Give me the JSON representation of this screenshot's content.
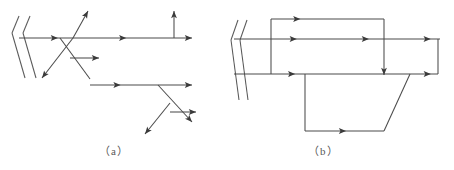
{
  "figure": {
    "background_color": "#ffffff",
    "line_color": "#4b4b4b",
    "arrow_color": "#3a3a3a",
    "width": 454,
    "height": 170
  },
  "panels": [
    {
      "id": "panel-a",
      "caption": "（a）",
      "caption_plain": "( a )",
      "caption_position": {
        "x": 99,
        "y": 142
      },
      "description": "Branching ray diagram with a tilted mirror at the left and multiple split beams",
      "mirror": {
        "name": "mirror-a",
        "lines": [
          {
            "x1": 19,
            "y1": 16,
            "x2": 12,
            "y2": 33
          },
          {
            "x1": 30,
            "y1": 16,
            "x2": 23,
            "y2": 33
          },
          {
            "x1": 12,
            "y1": 33,
            "x2": 25,
            "y2": 78
          },
          {
            "x1": 23,
            "y1": 33,
            "x2": 36,
            "y2": 78
          }
        ]
      },
      "rays": [
        {
          "name": "ray-incident-horizontal",
          "x1": 19,
          "y1": 38,
          "x2": 192,
          "y2": 38,
          "arrows": [
            {
              "at": 0.225,
              "dir": 0
            },
            {
              "at": 0.62,
              "dir": 0
            },
            {
              "at": 1.0,
              "dir": 0
            }
          ]
        },
        {
          "name": "ray-up-right-branch",
          "x1": 73,
          "y1": 38,
          "x2": 88,
          "y2": 11,
          "arrows": [
            {
              "at": 1.0,
              "dir": -61
            }
          ]
        },
        {
          "name": "ray-down-left-branch",
          "x1": 73,
          "y1": 38,
          "x2": 42,
          "y2": 78,
          "arrows": [
            {
              "at": 1.0,
              "dir": 128
            }
          ]
        },
        {
          "name": "ray-down-right-branch",
          "x1": 60,
          "y1": 38,
          "x2": 90,
          "y2": 79,
          "arrows": []
        },
        {
          "name": "ray-mid-horizontal-short",
          "x1": 70,
          "y1": 58,
          "x2": 99,
          "y2": 58,
          "arrows": [
            {
              "at": 1.0,
              "dir": 0
            }
          ]
        },
        {
          "name": "ray-vertical-up",
          "x1": 174,
          "y1": 38,
          "x2": 174,
          "y2": 11,
          "arrows": [
            {
              "at": 1.0,
              "dir": -90
            }
          ]
        },
        {
          "name": "ray-lower-horizontal",
          "x1": 90,
          "y1": 85,
          "x2": 192,
          "y2": 85,
          "arrows": [
            {
              "at": 0.3,
              "dir": 0
            },
            {
              "at": 1.0,
              "dir": 0
            }
          ]
        },
        {
          "name": "ray-lower-down-left",
          "x1": 170,
          "y1": 103,
          "x2": 145,
          "y2": 134,
          "arrows": [
            {
              "at": 1.0,
              "dir": 129
            }
          ]
        },
        {
          "name": "ray-lower-down-right",
          "x1": 158,
          "y1": 85,
          "x2": 192,
          "y2": 122,
          "arrows": [
            {
              "at": 1.0,
              "dir": 47
            }
          ]
        },
        {
          "name": "ray-lower-right-horizontal",
          "x1": 170,
          "y1": 112,
          "x2": 196,
          "y2": 112,
          "arrows": [
            {
              "at": 1.0,
              "dir": 0
            }
          ]
        }
      ]
    },
    {
      "id": "panel-b",
      "caption": "（b）",
      "caption_plain": "( b )",
      "caption_position": {
        "x": 308,
        "y": 142
      },
      "description": "Closed-loop ray diagram with a tilted mirror at the left, a rectangular circuit and a lower trapezoidal circuit",
      "mirror": {
        "name": "mirror-b",
        "lines": [
          {
            "x1": 238,
            "y1": 20,
            "x2": 231,
            "y2": 40
          },
          {
            "x1": 247,
            "y1": 20,
            "x2": 240,
            "y2": 40
          },
          {
            "x1": 231,
            "y1": 40,
            "x2": 239,
            "y2": 100
          },
          {
            "x1": 240,
            "y1": 40,
            "x2": 248,
            "y2": 100
          }
        ]
      },
      "rays": [
        {
          "name": "ray-b-upper-horizontal",
          "x1": 234,
          "y1": 39,
          "x2": 440,
          "y2": 39,
          "arrows": [
            {
              "at": 0.305,
              "dir": 0
            },
            {
              "at": 0.655,
              "dir": 0
            },
            {
              "at": 0.955,
              "dir": 0
            }
          ]
        },
        {
          "name": "ray-b-lower-horizontal",
          "x1": 234,
          "y1": 74,
          "x2": 438,
          "y2": 74,
          "arrows": [
            {
              "at": 0.3,
              "dir": 0
            },
            {
              "at": 0.965,
              "dir": 0
            }
          ]
        },
        {
          "name": "ray-b-top-horizontal",
          "x1": 271,
          "y1": 19,
          "x2": 384,
          "y2": 19,
          "arrows": [
            {
              "at": 0.26,
              "dir": 0
            }
          ]
        },
        {
          "name": "ray-b-left-vertical",
          "x1": 271,
          "y1": 19,
          "x2": 271,
          "y2": 74,
          "arrows": []
        },
        {
          "name": "ray-b-right-vertical-down",
          "x1": 384,
          "y1": 19,
          "x2": 384,
          "y2": 75,
          "arrows": [
            {
              "at": 1.0,
              "dir": 90
            }
          ]
        },
        {
          "name": "ray-b-right-rect-vertical",
          "x1": 438,
          "y1": 39,
          "x2": 438,
          "y2": 74,
          "arrows": []
        },
        {
          "name": "ray-b-trapezoid-left-vertical",
          "x1": 305,
          "y1": 74,
          "x2": 305,
          "y2": 131,
          "arrows": []
        },
        {
          "name": "ray-b-trapezoid-bottom",
          "x1": 305,
          "y1": 131,
          "x2": 384,
          "y2": 131,
          "arrows": [
            {
              "at": 0.52,
              "dir": 0
            }
          ]
        },
        {
          "name": "ray-b-trapezoid-slant",
          "x1": 384,
          "y1": 131,
          "x2": 410,
          "y2": 74,
          "arrows": []
        }
      ]
    }
  ]
}
